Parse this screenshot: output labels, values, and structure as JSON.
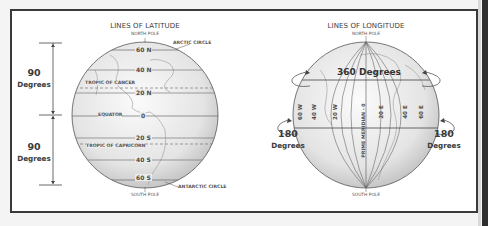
{
  "latitude": {
    "title": "LINES OF LATITUDE",
    "north_pole": "NORTH POLE",
    "south_pole": "SOUTH POLE",
    "arctic_circle": "ARCTIC CIRCLE",
    "antarctic_circle": "ANTARCTIC CIRCLE",
    "tropic_of_cancer": "TROPIC OF CANCER",
    "tropic_of_capricorn": "TROPIC OF CAPRICORN",
    "equator": "EQUATOR",
    "lines": [
      {
        "label": "60 N"
      },
      {
        "label": "40 N"
      },
      {
        "label": "20 N"
      },
      {
        "label": "0"
      },
      {
        "label": "20 S"
      },
      {
        "label": "40 S"
      },
      {
        "label": "60 S"
      }
    ],
    "upper_span": {
      "value": "90",
      "unit": "Degrees"
    },
    "lower_span": {
      "value": "90",
      "unit": "Degrees"
    }
  },
  "longitude": {
    "title": "LINES OF LONGITUDE",
    "north_pole": "NORTH POLE",
    "south_pole": "SOUTH POLE",
    "full_rotation": "360 Degrees",
    "prime_meridian": "PRIME MERIDIAN - 0",
    "lines": [
      {
        "label": "60 W"
      },
      {
        "label": "40 W"
      },
      {
        "label": "20 W"
      },
      {
        "label": "20 E"
      },
      {
        "label": "40 E"
      },
      {
        "label": "60 E"
      }
    ],
    "west_span": {
      "value": "180",
      "unit": "Degrees"
    },
    "east_span": {
      "value": "180",
      "unit": "Degrees"
    }
  },
  "colors": {
    "frame": "#3a3a3a",
    "globe_fill": "#e6e6e6",
    "line": "#4a4a4a"
  }
}
